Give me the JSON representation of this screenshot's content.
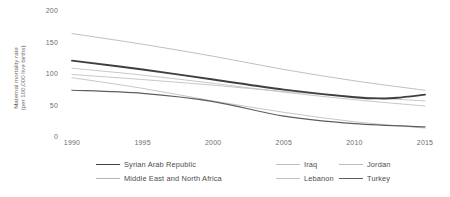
{
  "chart_data": {
    "type": "line",
    "title": "",
    "subtitle": "",
    "xlabel": "",
    "ylabel": "Maternal mortality rate (per 100,000 live births)",
    "ylabel_line1": "Maternal mortality rate",
    "ylabel_line2": "(per 100,000 live births)",
    "x": [
      1990,
      1995,
      2000,
      2005,
      2010,
      2015
    ],
    "xlim": [
      1990,
      2015
    ],
    "ylim": [
      0,
      200
    ],
    "yticks": [
      0,
      50,
      100,
      150,
      200
    ],
    "ytick_labels": [
      "0",
      "50",
      "100",
      "150",
      "200"
    ],
    "xticks": [
      1990,
      1995,
      2000,
      2005,
      2010,
      2015
    ],
    "xtick_labels": [
      "1990",
      "1995",
      "2000",
      "2005",
      "2010",
      "2015"
    ],
    "grid": false,
    "legend_position": "bottom",
    "series": [
      {
        "name": "Syrian Arab Republic",
        "color": "#3f3f3f",
        "width": 1.9,
        "emphasis": "primary",
        "x": [
          1990,
          1995,
          2000,
          2005,
          2010,
          2012,
          2013,
          2015
        ],
        "values": [
          122,
          108,
          92,
          76,
          64,
          62,
          63,
          68
        ]
      },
      {
        "name": "Middle East and North Africa",
        "color": "#b4b4b4",
        "width": 0.85,
        "emphasis": "secondary",
        "x": [
          1990,
          1995,
          2000,
          2005,
          2010,
          2015
        ],
        "values": [
          165,
          148,
          129,
          108,
          90,
          75
        ]
      },
      {
        "name": "Iraq",
        "color": "#bdbdbd",
        "width": 0.85,
        "emphasis": "secondary",
        "x": [
          1990,
          1995,
          2000,
          2005,
          2010,
          2015
        ],
        "values": [
          110,
          99,
          86,
          72,
          60,
          50
        ]
      },
      {
        "name": "Lebanon",
        "color": "#c0c0c0",
        "width": 0.9,
        "emphasis": "secondary",
        "x": [
          1990,
          1995,
          2000,
          2005,
          2010,
          2015
        ],
        "values": [
          95,
          78,
          58,
          40,
          25,
          15
        ]
      },
      {
        "name": "Jordan",
        "color": "#bdbdbd",
        "width": 0.85,
        "emphasis": "secondary",
        "x": [
          1990,
          1995,
          2000,
          2005,
          2010,
          2015
        ],
        "values": [
          100,
          92,
          83,
          73,
          65,
          58
        ]
      },
      {
        "name": "Turkey",
        "color": "#5e5e5e",
        "width": 1.25,
        "emphasis": "primary",
        "x": [
          1990,
          1995,
          2000,
          2005,
          2010,
          2015
        ],
        "values": [
          75,
          70,
          57,
          34,
          22,
          17
        ]
      }
    ],
    "legend_rows": [
      [
        {
          "name": "Syrian Arab Republic",
          "color": "#3f3f3f",
          "width": 1.9,
          "left": 0,
          "label_width": 100
        },
        {
          "name": "Iraq",
          "color": "#bdbdbd",
          "width": 0.85,
          "left": 180,
          "label_width": 40
        },
        {
          "name": "Jordan",
          "color": "#bdbdbd",
          "width": 0.85,
          "left": 243,
          "label_width": 45
        }
      ],
      [
        {
          "name": "Middle East and North Africa",
          "color": "#b4b4b4",
          "width": 0.85,
          "left": 0,
          "label_width": 140
        },
        {
          "name": "Lebanon",
          "color": "#c0c0c0",
          "width": 0.9,
          "left": 180,
          "label_width": 50
        },
        {
          "name": "Turkey",
          "color": "#5e5e5e",
          "width": 1.25,
          "left": 243,
          "label_width": 45
        }
      ]
    ]
  }
}
